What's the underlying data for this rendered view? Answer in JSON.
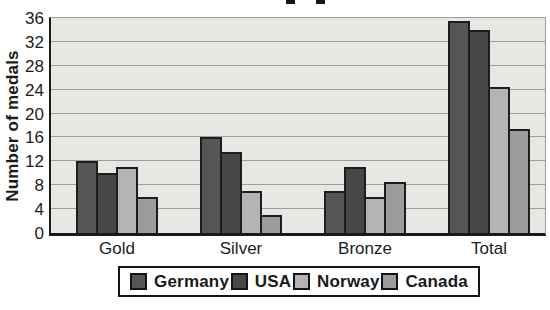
{
  "chart_data": {
    "type": "bar",
    "title": "",
    "title_cropped": true,
    "ylabel": "Number of medals",
    "xlabel": "",
    "categories": [
      "Gold",
      "Silver",
      "Bronze",
      "Total"
    ],
    "series": [
      {
        "name": "Germany",
        "color": "#565656",
        "values": [
          12,
          16,
          7,
          35.5
        ]
      },
      {
        "name": "USA",
        "color": "#474747",
        "values": [
          10,
          13.5,
          11,
          34
        ]
      },
      {
        "name": "Norway",
        "color": "#b4b4b4",
        "values": [
          11,
          7,
          6,
          24.5
        ]
      },
      {
        "name": "Canada",
        "color": "#9c9c9c",
        "values": [
          6,
          3,
          8.5,
          17.5
        ]
      }
    ],
    "ylim": [
      0,
      36
    ],
    "ytick_step": 4,
    "grid": true,
    "legend_position": "bottom",
    "plot_background": "#e7e7e3",
    "gridline_color": "#9c9d9d",
    "bar_border_color": "#1d1d1d"
  }
}
